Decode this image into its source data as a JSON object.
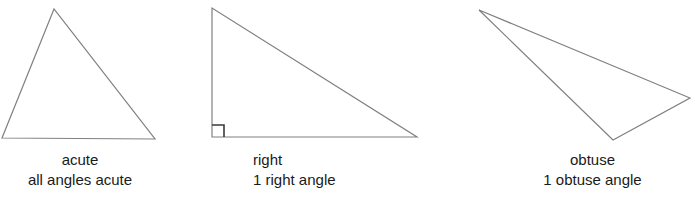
{
  "figure": {
    "background_color": "#ffffff",
    "stroke_color": "#808080",
    "angle_mark_color": "#3a3a3a",
    "text_color": "#1a1a1a"
  },
  "triangles": [
    {
      "id": "acute",
      "name_label": "acute",
      "description_label": "all angles acute",
      "vertices": "54,9 2,138 155,139",
      "has_right_angle_mark": false
    },
    {
      "id": "right",
      "name_label": "right",
      "description_label": "1 right angle",
      "vertices": "212,8 212,137 417,137",
      "has_right_angle_mark": true,
      "right_angle_mark": "212,125 224,125 224,137"
    },
    {
      "id": "obtuse",
      "name_label": "obtuse",
      "description_label": "1 obtuse angle",
      "vertices": "479,10 690,98 613,140",
      "has_right_angle_mark": false
    }
  ],
  "chart_data": {
    "type": "diagram",
    "categories": [
      "acute",
      "right",
      "obtuse"
    ],
    "items": [
      {
        "label": "acute",
        "detail": "all angles acute"
      },
      {
        "label": "right",
        "detail": "1 right angle"
      },
      {
        "label": "obtuse",
        "detail": "1 obtuse angle"
      }
    ]
  }
}
